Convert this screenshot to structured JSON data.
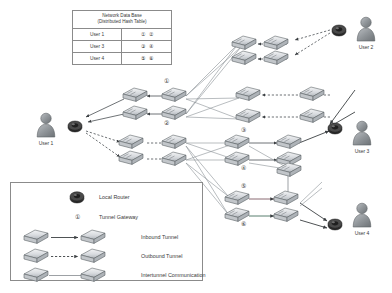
{
  "database": {
    "header_line1": "Network Data Base",
    "header_line2": "(Distributed Hash Table)",
    "col_user_header": "",
    "rows": [
      {
        "user": "User 1",
        "ids": [
          "①",
          "②"
        ]
      },
      {
        "user": "User 3",
        "ids": [
          "③",
          "④"
        ]
      },
      {
        "user": "User 4",
        "ids": [
          "⑤",
          "⑥"
        ]
      }
    ]
  },
  "legend": {
    "items": [
      {
        "icon": "local-router-icon",
        "label": "Local Router"
      },
      {
        "icon": "tunnel-gateway-number-icon",
        "label": "Tunnel Gateway",
        "symbol": "①"
      },
      {
        "icon": "inbound-tunnel-icon",
        "label": "Inbound Tunnel"
      },
      {
        "icon": "outbound-tunnel-icon",
        "label": "Outbound Tunnel"
      },
      {
        "icon": "intertunnel-communication-icon",
        "label": "Intertunnel Communication"
      }
    ]
  },
  "users": [
    {
      "id": "user-1",
      "label": "User 1"
    },
    {
      "id": "user-2",
      "label": "User 2"
    },
    {
      "id": "user-3",
      "label": "User 3"
    },
    {
      "id": "user-4",
      "label": "User 4"
    }
  ],
  "gateways": [
    {
      "id": "gateway-1",
      "label": "①"
    },
    {
      "id": "gateway-2",
      "label": "②"
    },
    {
      "id": "gateway-3",
      "label": "③"
    },
    {
      "id": "gateway-4",
      "label": "④"
    },
    {
      "id": "gateway-5",
      "label": "⑤"
    },
    {
      "id": "gateway-6",
      "label": "⑥"
    }
  ],
  "colors": {
    "router_body": "#d9dce0",
    "router_edge": "#5e6468",
    "local_router": "#3c3c3c",
    "avatar": "#8d9196",
    "line": "#6b7176",
    "border": "#8b8b8b",
    "text": "#3a3a3a"
  }
}
